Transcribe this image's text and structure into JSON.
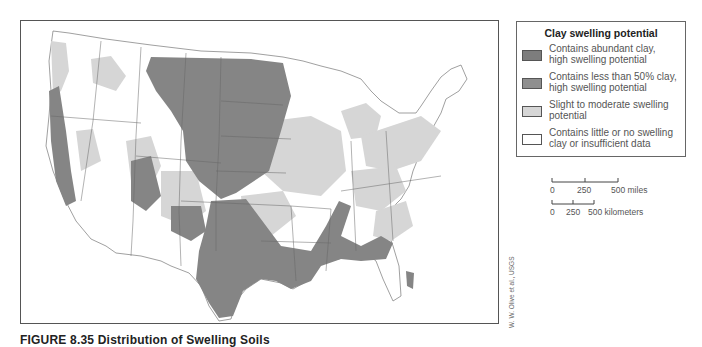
{
  "figure": {
    "caption": "FIGURE 8.35  Distribution of Swelling Soils",
    "credit": "W. W. Olive et al., USGS"
  },
  "map": {
    "region": "Contiguous United States",
    "colors": {
      "abundant_clay": "#7d7d7d",
      "less_than_50": "#8a8a8a",
      "slight_moderate": "#d6d6d6",
      "little_none": "#ffffff",
      "border": "#555555"
    }
  },
  "legend": {
    "title": "Clay swelling potential",
    "items": [
      {
        "label": "Contains abundant clay, high swelling potential",
        "line1": "Contains abundant clay,",
        "line2": "high swelling potential",
        "color": "#7d7d7d"
      },
      {
        "label": "Contains less than 50% clay, high swelling potential",
        "line1": "Contains less than 50% clay,",
        "line2": "high swelling potential",
        "color": "#8f8f8f"
      },
      {
        "label": "Slight to moderate swelling potential",
        "line1": "Slight to moderate swelling",
        "line2": "potential",
        "color": "#d6d6d6"
      },
      {
        "label": "Contains little or no swelling clay or insufficient data",
        "line1": "Contains little or no swelling",
        "line2": "clay or insufficient data",
        "color": "#ffffff"
      }
    ]
  },
  "scale_bar": {
    "miles": {
      "ticks": [
        "0",
        "250",
        "500 miles"
      ]
    },
    "kilometers": {
      "ticks": [
        "0",
        "250",
        "500 kilometers"
      ]
    }
  }
}
